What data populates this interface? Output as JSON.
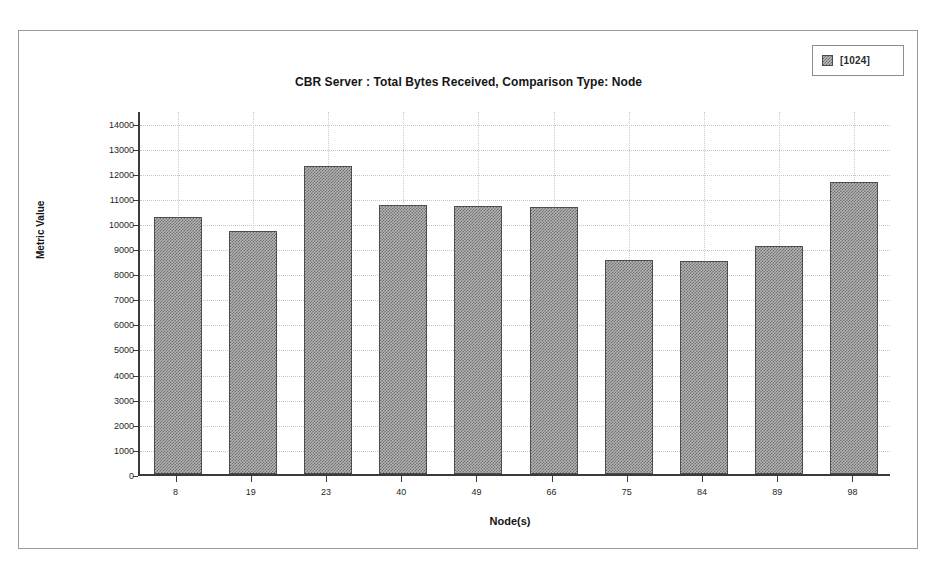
{
  "window": {
    "background_color": "#ffffff",
    "frame_color": "#9a9a9a"
  },
  "legend": {
    "position": "top-right",
    "entries": [
      {
        "label": "[1024]",
        "swatch": "hatched-gray-swatch",
        "color": "#808080"
      }
    ]
  },
  "chart_data": {
    "type": "bar",
    "title": "CBR Server :  Total Bytes Received, Comparison Type: Node",
    "xlabel": "Node(s)",
    "ylabel": "Metric Value",
    "categories": [
      "8",
      "19",
      "23",
      "40",
      "49",
      "66",
      "75",
      "84",
      "89",
      "98"
    ],
    "values": [
      10230,
      9670,
      12250,
      10720,
      10680,
      10640,
      8530,
      8490,
      9080,
      11620
    ],
    "series": [
      {
        "name": "[1024]",
        "values": [
          10230,
          9670,
          12250,
          10720,
          10680,
          10640,
          8530,
          8490,
          9080,
          11620
        ]
      }
    ],
    "ylim": [
      0,
      14500
    ],
    "ytick_values": [
      0,
      1000,
      2000,
      3000,
      4000,
      5000,
      6000,
      7000,
      8000,
      9000,
      10000,
      11000,
      12000,
      13000,
      14000
    ],
    "ytick_labels": [
      "0",
      "1000",
      "2000",
      "3000",
      "4000",
      "5000",
      "6000",
      "7000",
      "8000",
      "9000",
      "10000",
      "11000",
      "12000",
      "13000",
      "14000"
    ],
    "grid": true,
    "legend_position": "top-right",
    "bar_color": "#808080",
    "bar_edge_color": "#4d4d4d",
    "axis_color": "#3a3a3a",
    "grid_color": "#c4c4c4"
  }
}
